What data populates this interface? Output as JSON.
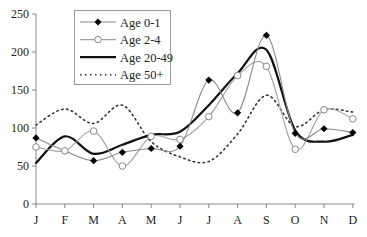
{
  "chart_data": {
    "type": "line",
    "title": "",
    "xlabel": "",
    "ylabel": "",
    "ylim": [
      0,
      250
    ],
    "yticks": [
      0,
      50,
      100,
      150,
      200,
      250
    ],
    "grid": false,
    "legend_position": "top-left (inside)",
    "categories": [
      "J",
      "F",
      "M",
      "A",
      "M",
      "J",
      "J",
      "A",
      "S",
      "O",
      "N",
      "D"
    ],
    "series": [
      {
        "name": "Age 0-1",
        "style": "thin gray line, filled black diamond markers",
        "color": "#888888",
        "marker": "filled",
        "values": [
          87,
          70,
          57,
          68,
          73,
          76,
          163,
          120,
          222,
          93,
          99,
          94
        ]
      },
      {
        "name": "Age 2-4",
        "style": "thin gray line, open circle markers",
        "color": "#999999",
        "marker": "open",
        "values": [
          75,
          70,
          96,
          50,
          89,
          85,
          115,
          169,
          181,
          72,
          124,
          112
        ]
      },
      {
        "name": "Age 20-49",
        "style": "thick black solid line",
        "color": "#111111",
        "marker": "none",
        "values": [
          54,
          89,
          66,
          78,
          91,
          95,
          130,
          172,
          203,
          97,
          82,
          91
        ]
      },
      {
        "name": "Age 50+",
        "style": "dotted dark line",
        "color": "#333333",
        "marker": "none",
        "values": [
          104,
          125,
          106,
          130,
          82,
          62,
          56,
          92,
          143,
          102,
          124,
          121
        ]
      }
    ]
  }
}
